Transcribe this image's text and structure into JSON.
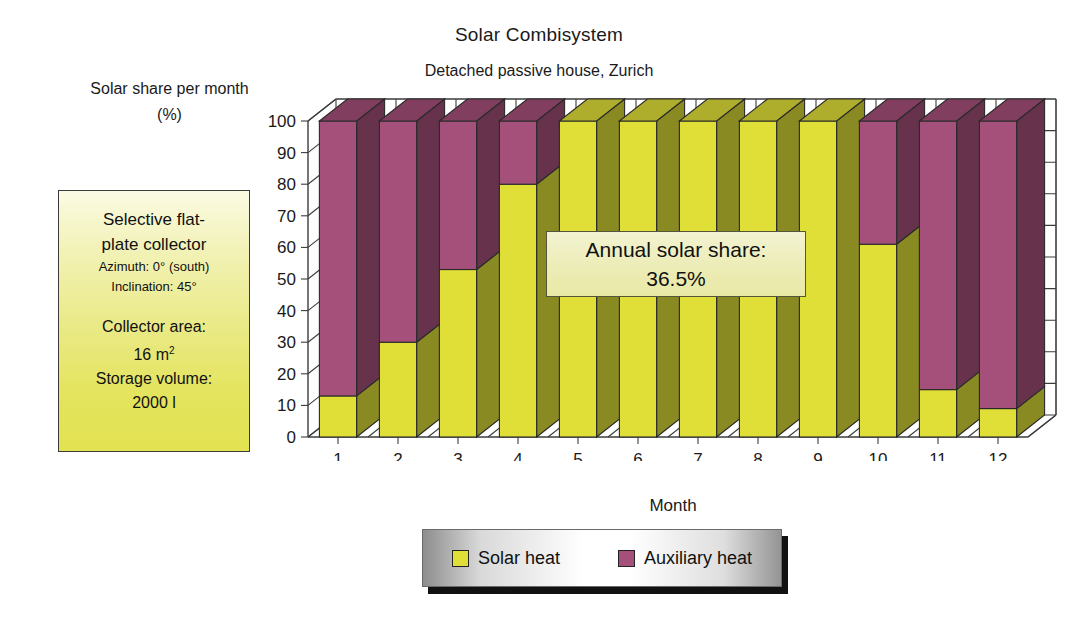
{
  "header": {
    "title": "Solar Combisystem",
    "subtitle": "Detached passive house, Zurich"
  },
  "y_caption": {
    "line1": "Solar share per month",
    "line2": "(%)"
  },
  "info_box": {
    "heading_line1": "Selective flat-",
    "heading_line2": "plate collector",
    "azimuth": "Azimuth: 0° (south)",
    "inclination": "Inclination: 45°",
    "collector_area_label": "Collector area:",
    "collector_area_value": "16 m",
    "collector_area_exp": "2",
    "storage_label": "Storage volume:",
    "storage_value": "2000 l"
  },
  "annotation": {
    "line1": "Annual solar share:",
    "line2": "36.5%"
  },
  "legend": {
    "items": [
      {
        "label": "Solar heat",
        "color": "#dfdf38"
      },
      {
        "label": "Auxiliary heat",
        "color": "#a5507a"
      }
    ]
  },
  "chart_data": {
    "type": "bar",
    "stacked": true,
    "title": "Solar Combisystem",
    "subtitle": "Detached passive house, Zurich",
    "xlabel": "Month",
    "ylabel": "Solar share per month (%)",
    "ylim": [
      0,
      100
    ],
    "yticks": [
      0,
      10,
      20,
      30,
      40,
      50,
      60,
      70,
      80,
      90,
      100
    ],
    "grid": true,
    "legend_position": "bottom",
    "categories": [
      "1",
      "2",
      "3",
      "4",
      "5",
      "6",
      "7",
      "8",
      "9",
      "10",
      "11",
      "12"
    ],
    "series": [
      {
        "name": "Solar heat",
        "color": "#dfdf38",
        "values": [
          13,
          30,
          53,
          80,
          100,
          100,
          100,
          100,
          100,
          61,
          15,
          9
        ]
      },
      {
        "name": "Auxiliary heat",
        "color": "#a5507a",
        "values": [
          87,
          70,
          47,
          20,
          0,
          0,
          0,
          0,
          0,
          39,
          85,
          91
        ]
      }
    ],
    "annotation": "Annual solar share: 36.5%"
  }
}
